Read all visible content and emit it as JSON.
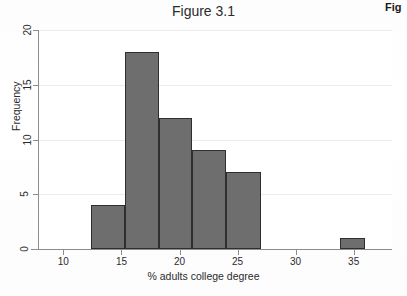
{
  "figure": {
    "title": "Figure 3.1",
    "bleed_caption": "Fig"
  },
  "axes": {
    "x_tick_labels": [
      "10",
      "15",
      "20",
      "25",
      "30",
      "35"
    ],
    "y_tick_labels": [
      "0",
      "5",
      "10",
      "15",
      "20"
    ],
    "x_title": "% adults college degree",
    "y_title": "Frequency"
  },
  "colors": {
    "bar_fill": "#6e6e6e",
    "bar_edge": "#2f2f2f",
    "axis": "#8d8d8d",
    "grid": "#ececec",
    "text": "#2b2b2b",
    "background": "#ffffff"
  },
  "chart_data": {
    "type": "bar",
    "title": "Figure 3.1",
    "xlabel": "% adults college degree",
    "ylabel": "Frequency",
    "xlim": [
      7.9,
      38.3
    ],
    "ylim": [
      0,
      20
    ],
    "xticks": [
      10,
      15,
      20,
      25,
      30,
      35
    ],
    "yticks": [
      0,
      5,
      10,
      15,
      20
    ],
    "grid": true,
    "legend": null,
    "histogram": true,
    "bin_edges": [
      12.4,
      15.3,
      18.2,
      21.1,
      24.0,
      27.0
    ],
    "categories": [
      "12.4-15.3",
      "15.3-18.2",
      "18.2-21.1",
      "21.1-24.0",
      "24.0-27.0",
      "33.8-36.0"
    ],
    "values": [
      4,
      18,
      12,
      9,
      7,
      1
    ],
    "bars": [
      {
        "x0": 12.4,
        "x1": 15.3,
        "value": 4
      },
      {
        "x0": 15.3,
        "x1": 18.2,
        "value": 18
      },
      {
        "x0": 18.2,
        "x1": 21.1,
        "value": 12
      },
      {
        "x0": 21.1,
        "x1": 24.0,
        "value": 9
      },
      {
        "x0": 24.0,
        "x1": 27.0,
        "value": 7
      },
      {
        "x0": 33.8,
        "x1": 36.0,
        "value": 1
      }
    ]
  }
}
